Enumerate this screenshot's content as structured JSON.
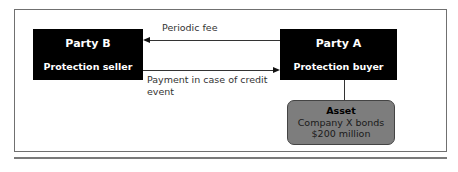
{
  "diagram": {
    "type": "credit-default-swap-flow",
    "party_b": {
      "name": "Party B",
      "role": "Protection seller",
      "fill": "#000000",
      "text_color": "#ffffff"
    },
    "party_a": {
      "name": "Party A",
      "role": "Protection buyer",
      "fill": "#000000",
      "text_color": "#ffffff"
    },
    "flows": [
      {
        "from": "Party A",
        "to": "Party B",
        "label": "Periodic fee"
      },
      {
        "from": "Party B",
        "to": "Party A",
        "label": "Payment in case of credit event"
      }
    ],
    "asset": {
      "title": "Asset",
      "line1": "Company X bonds",
      "line2": "$200 million",
      "fill": "#7d7d7d",
      "linked_to": "Party A"
    }
  }
}
